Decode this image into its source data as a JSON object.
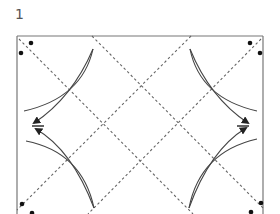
{
  "step": {
    "number": "1"
  },
  "diagram": {
    "type": "origami-fold-diagram",
    "paper_color": "#ffffff",
    "line_color": "#555555",
    "crease_color": "#666666",
    "dot_color": "#111111",
    "fold_lines": "dashed valley folds forming a diamond lattice",
    "arrows": [
      "upper-left-fold-arrow",
      "lower-left-fold-arrow",
      "upper-right-fold-arrow",
      "lower-right-fold-arrow"
    ]
  }
}
